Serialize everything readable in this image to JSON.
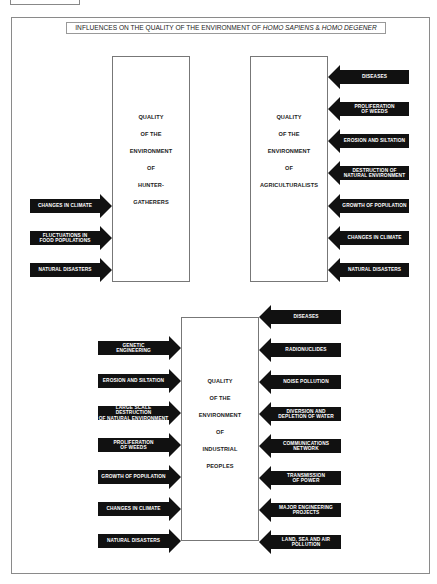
{
  "title": {
    "prefix": "INFLUENCES ON THE QUALITY OF THE ENVIRONMENT OF ",
    "species1": "HOMO SAPIENS",
    "amp": " & ",
    "species2": "HOMO DEGENER"
  },
  "boxes": {
    "hunter_gatherers": [
      "QUALITY",
      "OF THE",
      "ENVIRONMENT",
      "OF",
      "HUNTER-",
      "GATHERERS"
    ],
    "agriculturalists": [
      "QUALITY",
      "OF THE",
      "ENVIRONMENT",
      "OF",
      "AGRICULTURALISTS"
    ],
    "industrial": [
      "QUALITY",
      "OF THE",
      "ENVIRONMENT",
      "OF",
      "INDUSTRIAL",
      "PEOPLES"
    ]
  },
  "hunter_influences": [
    {
      "l1": "CHANGES IN CLIMATE",
      "l2": ""
    },
    {
      "l1": "FLUCTUATIONS IN",
      "l2": "FOOD POPULATIONS"
    },
    {
      "l1": "NATURAL DISASTERS",
      "l2": ""
    }
  ],
  "agri_influences": [
    {
      "l1": "DISEASES",
      "l2": ""
    },
    {
      "l1": "PROLIFERATION",
      "l2": "OF WEEDS"
    },
    {
      "l1": "EROSION AND SILTATION",
      "l2": ""
    },
    {
      "l1": "DESTRUCTION OF",
      "l2": "NATURAL ENVIRONMENT"
    },
    {
      "l1": "GROWTH OF POPULATION",
      "l2": ""
    },
    {
      "l1": "CHANGES IN CLIMATE",
      "l2": ""
    },
    {
      "l1": "NATURAL DISASTERS",
      "l2": ""
    }
  ],
  "industrial_left_influences": [
    {
      "l1": "GENETIC",
      "l2": "ENGINEERING"
    },
    {
      "l1": "EROSION AND SILTATION",
      "l2": ""
    },
    {
      "l1": "LARGE SCALE DESTRUCTION",
      "l2": "OF NATURAL ENVIRONMENT"
    },
    {
      "l1": "PROLIFERATION",
      "l2": "OF WEEDS"
    },
    {
      "l1": "GROWTH OF POPULATION",
      "l2": ""
    },
    {
      "l1": "CHANGES IN CLIMATE",
      "l2": ""
    },
    {
      "l1": "NATURAL DISASTERS",
      "l2": ""
    }
  ],
  "industrial_right_influences": [
    {
      "l1": "DISEASES",
      "l2": ""
    },
    {
      "l1": "RADIONUCLIDES",
      "l2": ""
    },
    {
      "l1": "NOISE POLLUTION",
      "l2": ""
    },
    {
      "l1": "DIVERSION AND",
      "l2": "DEPLETION OF WATER"
    },
    {
      "l1": "COMMUNICATIONS",
      "l2": "NETWORK"
    },
    {
      "l1": "TRANSMISSION",
      "l2": "OF POWER"
    },
    {
      "l1": "MAJOR ENGINEERING",
      "l2": "PROJECTS"
    },
    {
      "l1": "LAND, SEA AND AIR",
      "l2": "POLLUTION"
    }
  ],
  "colors": {
    "arrow": "#111111",
    "arrow_text": "#ffffff",
    "frame": "#8a8a8a"
  }
}
